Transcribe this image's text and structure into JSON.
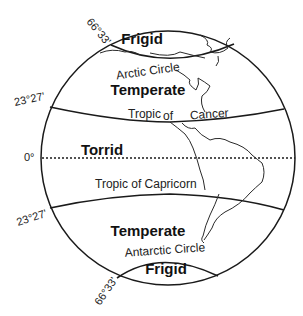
{
  "diagram": {
    "zones": {
      "north_frigid": "Frigid",
      "north_temperate": "Temperate",
      "torrid": "Torrid",
      "south_temperate": "Temperate",
      "south_frigid": "Frigid"
    },
    "lines": {
      "arctic_circle": "Arctic Circle",
      "tropic_of_cancer_1": "Tropic",
      "tropic_of_cancer_2": "of",
      "tropic_of_cancer_3": "Cancer",
      "tropic_of_capricorn": "Tropic of Capricorn",
      "antarctic_circle": "Antarctic Circle"
    },
    "latitudes": {
      "arctic": "66°33'",
      "cancer": "23°27'",
      "equator": "0°",
      "capricorn": "23°27'",
      "antarctic": "66°33'"
    },
    "colors": {
      "stroke": "#1a1a1a",
      "background": "#ffffff"
    }
  }
}
